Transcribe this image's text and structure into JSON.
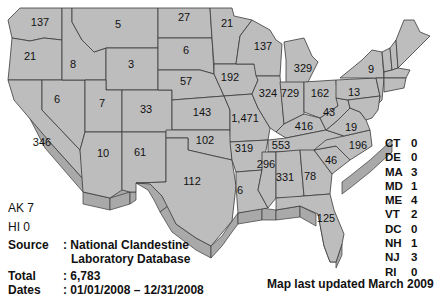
{
  "map": {
    "fill_color": "#bdbdbd",
    "border_color": "#3a3a3a",
    "states": [
      {
        "abbr": "WA",
        "value": "137"
      },
      {
        "abbr": "OR",
        "value": "21"
      },
      {
        "abbr": "CA",
        "value": "346"
      },
      {
        "abbr": "ID",
        "value": "8"
      },
      {
        "abbr": "NV",
        "value": "6"
      },
      {
        "abbr": "MT",
        "value": "5"
      },
      {
        "abbr": "WY",
        "value": "3"
      },
      {
        "abbr": "UT",
        "value": "7"
      },
      {
        "abbr": "AZ",
        "value": "10"
      },
      {
        "abbr": "CO",
        "value": "33"
      },
      {
        "abbr": "NM",
        "value": "61"
      },
      {
        "abbr": "ND",
        "value": "27"
      },
      {
        "abbr": "SD",
        "value": "6"
      },
      {
        "abbr": "NE",
        "value": "57"
      },
      {
        "abbr": "KS",
        "value": "143"
      },
      {
        "abbr": "OK",
        "value": "102"
      },
      {
        "abbr": "TX",
        "value": "112"
      },
      {
        "abbr": "MN",
        "value": "21"
      },
      {
        "abbr": "IA",
        "value": "192"
      },
      {
        "abbr": "MO",
        "value": "1,471"
      },
      {
        "abbr": "AR",
        "value": "319"
      },
      {
        "abbr": "LA",
        "value": "6"
      },
      {
        "abbr": "WI",
        "value": "137"
      },
      {
        "abbr": "IL",
        "value": "324"
      },
      {
        "abbr": "MI",
        "value": "329"
      },
      {
        "abbr": "IN",
        "value": "729"
      },
      {
        "abbr": "OH",
        "value": "162"
      },
      {
        "abbr": "KY",
        "value": "416"
      },
      {
        "abbr": "TN",
        "value": "553"
      },
      {
        "abbr": "MS",
        "value": "296"
      },
      {
        "abbr": "AL",
        "value": "331"
      },
      {
        "abbr": "GA",
        "value": "78"
      },
      {
        "abbr": "FL",
        "value": "125"
      },
      {
        "abbr": "SC",
        "value": "46"
      },
      {
        "abbr": "NC",
        "value": "196"
      },
      {
        "abbr": "VA",
        "value": "19"
      },
      {
        "abbr": "WV",
        "value": "43"
      },
      {
        "abbr": "PA",
        "value": "13"
      },
      {
        "abbr": "NY",
        "value": "9"
      }
    ],
    "small_states": [
      {
        "abbr": "CT",
        "value": "0"
      },
      {
        "abbr": "DE",
        "value": "0"
      },
      {
        "abbr": "MA",
        "value": "3"
      },
      {
        "abbr": "MD",
        "value": "1"
      },
      {
        "abbr": "ME",
        "value": "4"
      },
      {
        "abbr": "VT",
        "value": "2"
      },
      {
        "abbr": "DC",
        "value": "0"
      },
      {
        "abbr": "NH",
        "value": "1"
      },
      {
        "abbr": "NJ",
        "value": "3"
      },
      {
        "abbr": "RI",
        "value": "0"
      }
    ]
  },
  "alaska": "AK 7",
  "hawaii": "HI 0",
  "source": {
    "label": "Source",
    "value_line1": ": National Clandestine",
    "value_line2": "Laboratory Database"
  },
  "total": {
    "label": "Total",
    "value": ": 6,783"
  },
  "dates": {
    "label": "Dates",
    "value": ": 01/01/2008 – 12/31/2008"
  },
  "updated": "Map last updated March 2009"
}
